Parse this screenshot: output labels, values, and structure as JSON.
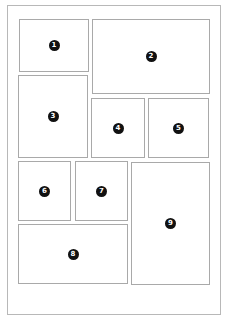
{
  "diagram": {
    "type": "page-layout-grid",
    "panels": [
      {
        "id": "1",
        "label": "1",
        "x": 19,
        "y": 19,
        "w": 70,
        "h": 53
      },
      {
        "id": "2",
        "label": "2",
        "x": 92,
        "y": 19,
        "w": 118,
        "h": 75
      },
      {
        "id": "3",
        "label": "3",
        "x": 18,
        "y": 75,
        "w": 70,
        "h": 83
      },
      {
        "id": "4",
        "label": "4",
        "x": 91,
        "y": 98,
        "w": 54,
        "h": 60
      },
      {
        "id": "5",
        "label": "5",
        "x": 148,
        "y": 98,
        "w": 61,
        "h": 60
      },
      {
        "id": "6",
        "label": "6",
        "x": 18,
        "y": 161,
        "w": 53,
        "h": 60
      },
      {
        "id": "7",
        "label": "7",
        "x": 75,
        "y": 161,
        "w": 53,
        "h": 60
      },
      {
        "id": "8",
        "label": "8",
        "x": 18,
        "y": 224,
        "w": 110,
        "h": 60
      },
      {
        "id": "9",
        "label": "9",
        "x": 131,
        "y": 162,
        "w": 79,
        "h": 123
      }
    ],
    "caption": "",
    "colors": {
      "border": "#a9a9a9",
      "badge": "#111111",
      "frame": "#b8b8b8"
    }
  }
}
